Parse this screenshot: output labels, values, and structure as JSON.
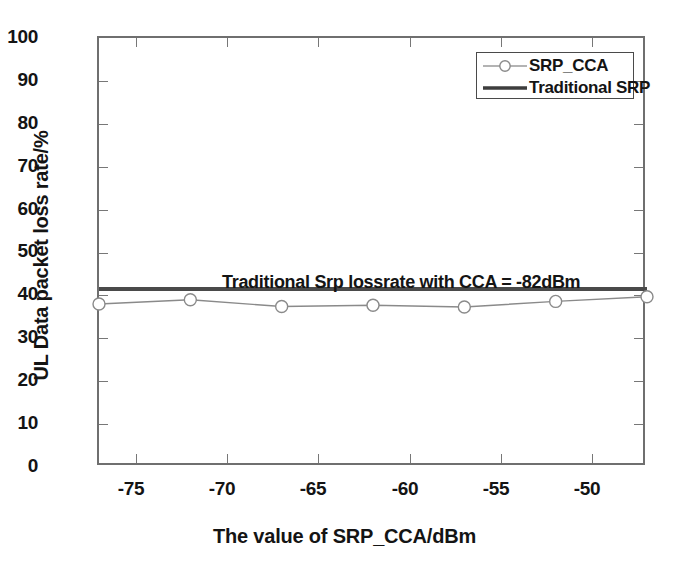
{
  "chart_data": {
    "type": "line",
    "title": "",
    "xlabel": "The value of SRP_CCA/dBm",
    "ylabel": "UL Data packet loss rate/%",
    "xlim": [
      -77,
      -47
    ],
    "ylim": [
      0,
      100
    ],
    "grid": false,
    "legend_position": "top-right",
    "x": [
      -77,
      -72,
      -67,
      -62,
      -57,
      -52,
      -47
    ],
    "xticks": [
      -75,
      -70,
      -65,
      -60,
      -55,
      -50
    ],
    "yticks": [
      0,
      10,
      20,
      30,
      40,
      50,
      60,
      70,
      80,
      90,
      100
    ],
    "series": [
      {
        "name": "SRP_CCA",
        "type": "line-marker",
        "marker": "circle",
        "color": "#8a8a8a",
        "values": [
          38.0,
          39.0,
          37.4,
          37.7,
          37.3,
          38.6,
          39.7
        ]
      },
      {
        "name": "Traditional SRP",
        "type": "horizontal-line",
        "color": "#4a4a4a",
        "value": 41.5
      }
    ],
    "annotations": [
      {
        "text": "Traditional Srp lossrate with CCA = -82dBm",
        "x": -48,
        "y": 44.5
      }
    ]
  },
  "axes": {
    "y_tick_labels": [
      "100",
      "90",
      "80",
      "70",
      "60",
      "50",
      "40",
      "30",
      "20",
      "10",
      "0"
    ],
    "x_tick_labels": [
      "-75",
      "-70",
      "-65",
      "-60",
      "-55",
      "-50"
    ],
    "x_title": "The value of SRP_CCA/dBm",
    "y_title": "UL Data packet loss rate/%"
  },
  "legend": {
    "entries": [
      {
        "label": "SRP_CCA",
        "style": "line-with-circle-marker"
      },
      {
        "label": "Traditional SRP",
        "style": "solid-thick-line"
      }
    ]
  },
  "annotation": {
    "line_label": "Traditional Srp lossrate with CCA = -82dBm"
  },
  "colors": {
    "axis": "#6f6f6f",
    "srp_cca_series": "#8a8a8a",
    "traditional_srp_series": "#4a4a4a",
    "text": "#141414",
    "background": "#ffffff"
  }
}
